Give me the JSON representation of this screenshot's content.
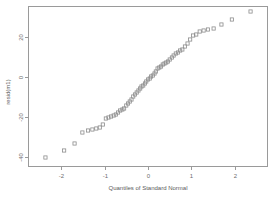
{
  "chart_data": {
    "type": "scatter",
    "title": "",
    "subtitle": "",
    "xlabel": "Quantiles of Standard Normal",
    "ylabel": "resid(m1)",
    "xlim": [
      -2.75,
      2.75
    ],
    "ylim": [
      -45,
      35
    ],
    "grid": false,
    "legend": null,
    "marker": "open-square",
    "marker_color": "#8c8c8c",
    "xticks": [
      -2,
      -1,
      0,
      1,
      2
    ],
    "xticklabels": [
      "-2",
      "-1",
      "0",
      "1",
      "2"
    ],
    "yticks": [
      20,
      0,
      -20,
      -40
    ],
    "yticklabels": [
      "20",
      "0",
      "-20",
      "-40"
    ],
    "series": [
      {
        "name": "residual quantiles",
        "x": [
          -2.36,
          -1.93,
          -1.69,
          -1.51,
          -1.38,
          -1.28,
          -1.19,
          -1.11,
          -1.04,
          -0.97,
          -0.91,
          -0.85,
          -0.79,
          -0.74,
          -0.69,
          -0.64,
          -0.59,
          -0.55,
          -0.5,
          -0.46,
          -0.42,
          -0.38,
          -0.34,
          -0.3,
          -0.26,
          -0.22,
          -0.18,
          -0.15,
          -0.11,
          -0.07,
          -0.04,
          0.0,
          0.04,
          0.07,
          0.11,
          0.15,
          0.18,
          0.22,
          0.26,
          0.3,
          0.34,
          0.38,
          0.42,
          0.46,
          0.5,
          0.55,
          0.59,
          0.64,
          0.69,
          0.74,
          0.79,
          0.85,
          0.91,
          0.97,
          1.04,
          1.11,
          1.19,
          1.28,
          1.38,
          1.51,
          1.69,
          1.93,
          2.36
        ],
        "y": [
          -40.5,
          -37.0,
          -33.5,
          -28.0,
          -27.0,
          -26.5,
          -26.0,
          -25.5,
          -24.0,
          -21.0,
          -20.5,
          -20.0,
          -19.5,
          -19.0,
          -18.0,
          -17.0,
          -16.5,
          -16.0,
          -14.5,
          -13.5,
          -12.5,
          -11.5,
          -10.0,
          -9.0,
          -8.0,
          -7.0,
          -6.0,
          -5.0,
          -4.5,
          -3.5,
          -2.5,
          -1.5,
          -1.0,
          0.0,
          0.5,
          1.5,
          2.5,
          4.0,
          4.5,
          5.0,
          6.0,
          6.5,
          7.0,
          7.5,
          8.5,
          9.5,
          10.5,
          11.5,
          12.0,
          13.0,
          13.5,
          15.0,
          16.5,
          18.5,
          20.5,
          21.0,
          22.5,
          23.0,
          23.5,
          24.0,
          26.0,
          28.5,
          32.5
        ]
      }
    ]
  },
  "figure": {
    "background_color": "#ffffff",
    "axis_color": "#9a9a9a",
    "text_color": "#6e6e6e"
  }
}
